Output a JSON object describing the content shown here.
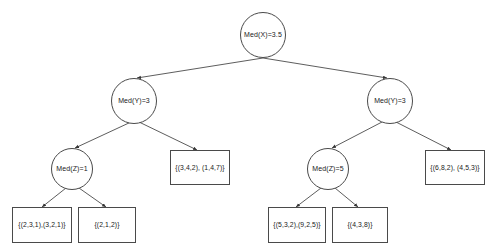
{
  "diagram": {
    "type": "kd-tree",
    "style": {
      "stroke_color": "#4a4a4a",
      "edge_color": "#333333",
      "text_color": "#1a1a1a",
      "background": "#ffffff"
    },
    "nodes": [
      {
        "id": "root",
        "shape": "circle",
        "label": "Med(X)=3.5",
        "x": 240,
        "y": 12,
        "width": 46,
        "height": 46
      },
      {
        "id": "left-y",
        "shape": "circle",
        "label": "Med(Y)=3",
        "x": 111,
        "y": 78,
        "width": 46,
        "height": 46
      },
      {
        "id": "right-y",
        "shape": "circle",
        "label": "Med(Y)=3",
        "x": 367,
        "y": 78,
        "width": 46,
        "height": 46
      },
      {
        "id": "left-z",
        "shape": "circle",
        "label": "Med(Z)=1",
        "x": 51,
        "y": 148,
        "width": 42,
        "height": 42
      },
      {
        "id": "leaf-mid-left",
        "shape": "box",
        "label": "{(3,4,2), (1,4,7)}",
        "x": 170,
        "y": 150,
        "width": 60,
        "height": 35
      },
      {
        "id": "right-z",
        "shape": "circle",
        "label": "Med(Z)=5",
        "x": 307,
        "y": 148,
        "width": 42,
        "height": 42
      },
      {
        "id": "leaf-right-far",
        "shape": "box",
        "label": "{(6,8,2), (4,5,3)}",
        "x": 425,
        "y": 150,
        "width": 60,
        "height": 35
      },
      {
        "id": "leaf-1",
        "shape": "box",
        "label": "{(2,3,1),(3,2,1)}",
        "x": 12,
        "y": 207,
        "width": 60,
        "height": 36
      },
      {
        "id": "leaf-2",
        "shape": "box",
        "label": "{(2,1,2)}",
        "x": 78,
        "y": 207,
        "width": 58,
        "height": 36
      },
      {
        "id": "leaf-3",
        "shape": "box",
        "label": "{(5,3,2),(9,2,5)}",
        "x": 268,
        "y": 207,
        "width": 58,
        "height": 36
      },
      {
        "id": "leaf-4",
        "shape": "box",
        "label": "{(4,3,8)}",
        "x": 332,
        "y": 207,
        "width": 56,
        "height": 36
      }
    ],
    "edges": [
      {
        "from": "root",
        "to": "left-y",
        "x1": 263,
        "y1": 58,
        "x2": 137,
        "y2": 78
      },
      {
        "from": "root",
        "to": "right-y",
        "x1": 263,
        "y1": 58,
        "x2": 387,
        "y2": 78
      },
      {
        "from": "left-y",
        "to": "left-z",
        "x1": 131,
        "y1": 122,
        "x2": 75,
        "y2": 148
      },
      {
        "from": "left-y",
        "to": "leaf-mid-left",
        "x1": 139,
        "y1": 122,
        "x2": 197,
        "y2": 150
      },
      {
        "from": "right-y",
        "to": "right-z",
        "x1": 382,
        "y1": 122,
        "x2": 332,
        "y2": 148
      },
      {
        "from": "right-y",
        "to": "leaf-right-far",
        "x1": 396,
        "y1": 122,
        "x2": 451,
        "y2": 150
      },
      {
        "from": "left-z",
        "to": "leaf-1",
        "x1": 66,
        "y1": 188,
        "x2": 42,
        "y2": 207
      },
      {
        "from": "left-z",
        "to": "leaf-2",
        "x1": 79,
        "y1": 188,
        "x2": 106,
        "y2": 207
      },
      {
        "from": "right-z",
        "to": "leaf-3",
        "x1": 321,
        "y1": 188,
        "x2": 296,
        "y2": 207
      },
      {
        "from": "right-z",
        "to": "leaf-4",
        "x1": 335,
        "y1": 188,
        "x2": 358,
        "y2": 207
      }
    ]
  }
}
